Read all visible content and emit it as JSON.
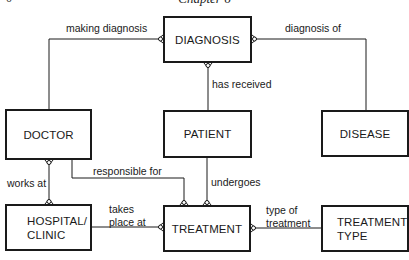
{
  "header": {
    "running_head": "Chapter 6",
    "page_mark": "0"
  },
  "entities": {
    "diagnosis": "DIAGNOSIS",
    "doctor": "DOCTOR",
    "patient": "PATIENT",
    "disease": "DISEASE",
    "hospital_clinic": "HOSPITAL/\nCLINIC",
    "treatment": "TREATMENT",
    "treatment_type": "TREATMENT\nTYPE"
  },
  "relationships": {
    "making_diagnosis": "making diagnosis",
    "diagnosis_of": "diagnosis of",
    "has_received": "has received",
    "works_at": "works at",
    "responsible_for": "responsible for",
    "undergoes": "undergoes",
    "takes_place_at": "takes\nplace at",
    "type_of_treatment": "type of\ntreatment"
  },
  "notation": {
    "many_end": "crow's foot",
    "optional_marker": "circle",
    "line_color": "#1a1a1a"
  }
}
